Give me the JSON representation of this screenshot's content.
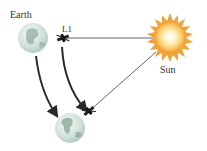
{
  "diagram": {
    "labels": {
      "earth": "Earth",
      "l1": "L1",
      "sun": "Sun"
    },
    "elements": {
      "earth_top": {
        "cx": 33,
        "cy": 38,
        "r": 15,
        "icon": "earth-globe-icon"
      },
      "earth_bottom": {
        "cx": 70,
        "cy": 128,
        "r": 15,
        "icon": "earth-globe-icon"
      },
      "sun": {
        "cx": 170,
        "cy": 37,
        "r": 17,
        "icon": "sun-icon"
      },
      "satellite_top": {
        "x": 63,
        "y": 38,
        "icon": "satellite-icon"
      },
      "satellite_bottom": {
        "x": 88,
        "y": 112,
        "icon": "satellite-icon"
      }
    },
    "colors": {
      "earth_ocean": "#d3e4de",
      "earth_land": "#8fae9c",
      "sun_core": "#fffbe6",
      "sun_mid": "#fbc96a",
      "sun_rays": "#f0a33a",
      "line": "#444444",
      "arrow": "#2a2a2a"
    }
  }
}
